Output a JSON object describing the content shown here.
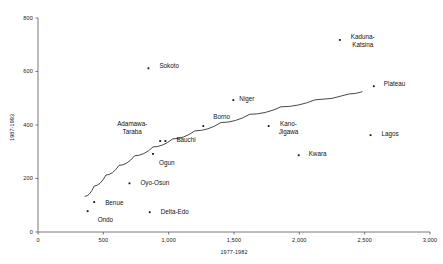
{
  "chart_data": {
    "type": "scatter",
    "title": "",
    "xlabel": "1977-1982",
    "ylabel": "1987-1993",
    "xlim": [
      0,
      3000
    ],
    "ylim": [
      0,
      800
    ],
    "xticks": [
      0,
      500,
      1000,
      1500,
      2000,
      2500,
      3000
    ],
    "xtick_labels": [
      "0",
      "500",
      "1,000",
      "1,500",
      "2,000",
      "2,500",
      "3,000"
    ],
    "yticks": [
      0,
      200,
      400,
      600,
      800
    ],
    "ytick_labels": [
      "0",
      "200",
      "400",
      "600",
      "800"
    ],
    "grid": false,
    "legend": null,
    "marker_color": "#111111",
    "line_color": "#333333",
    "points": [
      {
        "label": "Ondo",
        "x": 380,
        "y": 78,
        "lx": 10,
        "ly": 9,
        "align": "left",
        "lines": [
          "Ondo"
        ]
      },
      {
        "label": "Benue",
        "x": 430,
        "y": 112,
        "lx": 11,
        "ly": 1,
        "align": "left",
        "lines": [
          "Benue"
        ]
      },
      {
        "label": "Oyo-Osun",
        "x": 700,
        "y": 182,
        "lx": 11,
        "ly": 0,
        "align": "left",
        "lines": [
          "Oyo-Osun"
        ]
      },
      {
        "label": "Delta-Edo",
        "x": 855,
        "y": 74,
        "lx": 11,
        "ly": 0,
        "align": "left",
        "lines": [
          "Delta-Edo"
        ]
      },
      {
        "label": "Ogun",
        "x": 880,
        "y": 292,
        "lx": 6,
        "ly": 9,
        "align": "left",
        "lines": [
          "Ogun"
        ]
      },
      {
        "label": "Sokoto",
        "x": 845,
        "y": 612,
        "lx": 11,
        "ly": -2,
        "align": "left",
        "lines": [
          "Sokoto"
        ]
      },
      {
        "label": "Adamawa-Taraba",
        "x": 935,
        "y": 340,
        "lx": -13,
        "ly": -17,
        "align": "right",
        "lines": [
          "Adamawa-",
          "Taraba"
        ]
      },
      {
        "label": "Bauchi",
        "x": 975,
        "y": 340,
        "lx": 11,
        "ly": -1,
        "align": "left",
        "lines": [
          "Bauchi"
        ]
      },
      {
        "label": "Borno",
        "x": 1265,
        "y": 396,
        "lx": 10,
        "ly": -9,
        "align": "left",
        "lines": [
          "Borno"
        ]
      },
      {
        "label": "Niger",
        "x": 1495,
        "y": 493,
        "lx": 6,
        "ly": -1,
        "align": "left",
        "lines": [
          "Niger"
        ]
      },
      {
        "label": "Kano-Jigawa",
        "x": 1765,
        "y": 396,
        "lx": 10,
        "ly": -2,
        "align": "left",
        "lines": [
          "Kano-",
          "Jigawa"
        ]
      },
      {
        "label": "Kwara",
        "x": 1995,
        "y": 287,
        "lx": 10,
        "ly": -1,
        "align": "left",
        "lines": [
          "Kwara"
        ]
      },
      {
        "label": "Kaduna-Katsina",
        "x": 2310,
        "y": 718,
        "lx": 11,
        "ly": -3,
        "align": "left",
        "lines": [
          "Kaduna-",
          "Katsina"
        ]
      },
      {
        "label": "Lagos",
        "x": 2545,
        "y": 362,
        "lx": 11,
        "ly": -1,
        "align": "left",
        "lines": [
          "Lagos"
        ]
      },
      {
        "label": "Plateau",
        "x": 2570,
        "y": 545,
        "lx": 10,
        "ly": -2,
        "align": "left",
        "lines": [
          "Plateau"
        ]
      }
    ],
    "trend_line": {
      "name": "fitted-curve",
      "points": [
        {
          "x": 360,
          "y": 133
        },
        {
          "x": 430,
          "y": 172
        },
        {
          "x": 520,
          "y": 213
        },
        {
          "x": 620,
          "y": 249
        },
        {
          "x": 740,
          "y": 285
        },
        {
          "x": 880,
          "y": 318
        },
        {
          "x": 1030,
          "y": 348
        },
        {
          "x": 1200,
          "y": 378
        },
        {
          "x": 1400,
          "y": 409
        },
        {
          "x": 1620,
          "y": 440
        },
        {
          "x": 1860,
          "y": 468
        },
        {
          "x": 2120,
          "y": 494
        },
        {
          "x": 2380,
          "y": 516
        },
        {
          "x": 2480,
          "y": 524
        }
      ]
    }
  }
}
